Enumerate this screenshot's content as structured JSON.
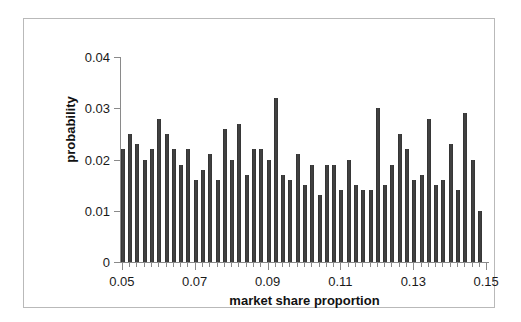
{
  "chart_data": {
    "type": "bar",
    "title": "",
    "xlabel": "market share proportion",
    "ylabel": "probability",
    "xlim": [
      0.0495,
      0.1505
    ],
    "ylim": [
      0,
      0.04
    ],
    "grid": false,
    "legend": null,
    "bar_color": "#3a3a3a",
    "x_tick_labels": [
      "0.05",
      "0.07",
      "0.09",
      "0.11",
      "0.13",
      "0.15"
    ],
    "x_tick_values": [
      0.05,
      0.07,
      0.09,
      0.11,
      0.13,
      0.15
    ],
    "y_tick_labels": [
      "0",
      "0.01",
      "0.02",
      "0.03",
      "0.04"
    ],
    "y_tick_values": [
      0,
      0.01,
      0.02,
      0.03,
      0.04
    ],
    "x": [
      0.05,
      0.052,
      0.054,
      0.056,
      0.058,
      0.06,
      0.062,
      0.064,
      0.066,
      0.068,
      0.07,
      0.072,
      0.074,
      0.076,
      0.078,
      0.08,
      0.082,
      0.084,
      0.086,
      0.088,
      0.09,
      0.092,
      0.094,
      0.096,
      0.098,
      0.1,
      0.102,
      0.104,
      0.106,
      0.108,
      0.11,
      0.112,
      0.114,
      0.116,
      0.118,
      0.12,
      0.122,
      0.124,
      0.126,
      0.128,
      0.13,
      0.132,
      0.134,
      0.136,
      0.138,
      0.14,
      0.142,
      0.144,
      0.146
    ],
    "categories": [
      "0.050",
      "0.052",
      "0.054",
      "0.056",
      "0.058",
      "0.060",
      "0.062",
      "0.064",
      "0.066",
      "0.068",
      "0.070",
      "0.072",
      "0.074",
      "0.076",
      "0.078",
      "0.080",
      "0.082",
      "0.084",
      "0.086",
      "0.088",
      "0.090",
      "0.092",
      "0.094",
      "0.096",
      "0.098",
      "0.100",
      "0.102",
      "0.104",
      "0.106",
      "0.108",
      "0.110",
      "0.112",
      "0.114",
      "0.116",
      "0.118",
      "0.120",
      "0.122",
      "0.124",
      "0.126",
      "0.128",
      "0.130",
      "0.132",
      "0.134",
      "0.136",
      "0.138",
      "0.140",
      "0.142",
      "0.144",
      "0.146"
    ],
    "values": [
      0.022,
      0.025,
      0.023,
      0.02,
      0.022,
      0.028,
      0.025,
      0.022,
      0.019,
      0.022,
      0.016,
      0.018,
      0.021,
      0.016,
      0.026,
      0.02,
      0.027,
      0.017,
      0.022,
      0.022,
      0.02,
      0.032,
      0.017,
      0.016,
      0.021,
      0.015,
      0.019,
      0.013,
      0.019,
      0.019,
      0.014,
      0.02,
      0.015,
      0.014,
      0.014,
      0.03,
      0.015,
      0.019,
      0.025,
      0.022,
      0.016,
      0.017,
      0.028,
      0.015,
      0.016,
      0.023,
      0.014,
      0.029,
      0.02
    ],
    "last_bar": {
      "x": 0.148,
      "value": 0.01
    }
  }
}
